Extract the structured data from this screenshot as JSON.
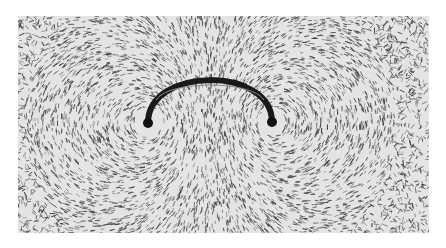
{
  "image": {
    "subject": "Iron filings showing the magnetic field around a semicircular current-carrying wire",
    "background_color": "#e4e4e4",
    "filings_color": "#3a3a3a",
    "wire_color": "#1a1a1a",
    "wire": {
      "left_end": [
        130,
        107
      ],
      "right_end": [
        254,
        106
      ],
      "apex_y": 61
    }
  }
}
